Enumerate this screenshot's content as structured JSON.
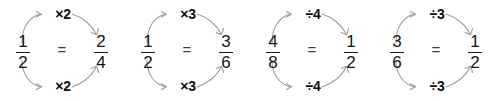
{
  "worksheet": {
    "title": "Equivalent fractions with multiply and divide arrows",
    "background_color": "#ffffff",
    "text_color": "#151515",
    "arrow_color": "#9a9a9a",
    "equals_symbol": "=",
    "groups": [
      {
        "id": "group-1",
        "left_fraction": {
          "numerator": "1",
          "denominator": "2"
        },
        "right_fraction": {
          "numerator": "2",
          "denominator": "4"
        },
        "equals": "=",
        "top_operation": "×2",
        "bottom_operation": "×2",
        "operation_kind": "multiply"
      },
      {
        "id": "group-2",
        "left_fraction": {
          "numerator": "1",
          "denominator": "2"
        },
        "right_fraction": {
          "numerator": "3",
          "denominator": "6"
        },
        "equals": "=",
        "top_operation": "×3",
        "bottom_operation": "×3",
        "operation_kind": "multiply"
      },
      {
        "id": "group-3",
        "left_fraction": {
          "numerator": "4",
          "denominator": "8"
        },
        "right_fraction": {
          "numerator": "1",
          "denominator": "2"
        },
        "equals": "=",
        "top_operation": "÷4",
        "bottom_operation": "÷4",
        "operation_kind": "divide"
      },
      {
        "id": "group-4",
        "left_fraction": {
          "numerator": "3",
          "denominator": "6"
        },
        "right_fraction": {
          "numerator": "1",
          "denominator": "2"
        },
        "equals": "=",
        "top_operation": "÷3",
        "bottom_operation": "÷3",
        "operation_kind": "divide"
      }
    ]
  }
}
